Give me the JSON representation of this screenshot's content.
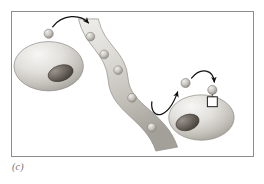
{
  "figure": {
    "caption": "(c)",
    "frame_color": "#8d8d90",
    "background_color": "#ffffff"
  },
  "palette": {
    "cell_light": "#f2f1ef",
    "cell_mid": "#d8d6d2",
    "cell_dark": "#a9a6a1",
    "cell_outline": "#8e8b86",
    "nucleus_light": "#8a837c",
    "nucleus_dark": "#4e4843",
    "nucleus_outline": "#3d3833",
    "matrix_light": "#e9e8e4",
    "matrix_mid": "#c9c7c1",
    "matrix_dark": "#a6a39c",
    "matrix_outline": "#908d87",
    "ligand_light": "#eceae6",
    "ligand_mid": "#c5c2bc",
    "ligand_dark": "#94918b",
    "ligand_outline": "#7c7973",
    "arrow_color": "#111111",
    "receptor_fill": "#ffffff",
    "receptor_outline": "#1a1a1a"
  },
  "elements": {
    "secreting_cell": {
      "label": "secreting cell",
      "cx": 48,
      "cy": 66,
      "rx": 35,
      "ry": 25,
      "nucleus": {
        "cx": 60,
        "cy": 73,
        "rx": 13,
        "ry": 8,
        "rotation": -18
      }
    },
    "target_cell": {
      "label": "target cell",
      "cx": 202,
      "cy": 118,
      "rx": 33,
      "ry": 23,
      "nucleus": {
        "cx": 188,
        "cy": 123,
        "rx": 12,
        "ry": 8,
        "rotation": -18
      }
    },
    "matrix_ribbon": {
      "label": "extracellular matrix fiber",
      "path": "M 78 18 L 98 18 C 104 46 126 50 128 78 C 130 106 166 112 178 148 L 156 152 C 146 120 110 112 108 80 C 106 52 84 46 78 18 Z",
      "embedded_ligands": [
        {
          "cx": 90,
          "cy": 36,
          "r": 4.4
        },
        {
          "cx": 104,
          "cy": 54,
          "r": 4.4
        },
        {
          "cx": 118,
          "cy": 70,
          "r": 4.4
        },
        {
          "cx": 132,
          "cy": 98,
          "r": 4.4
        },
        {
          "cx": 152,
          "cy": 128,
          "r": 4.4
        }
      ]
    },
    "free_ligands": [
      {
        "label": "released-ligand",
        "cx": 48,
        "cy": 33,
        "r": 4.6
      },
      {
        "label": "diffusing-ligand",
        "cx": 186,
        "cy": 83,
        "r": 4.6
      },
      {
        "label": "bound-ligand",
        "cx": 213,
        "cy": 90,
        "r": 4.6
      }
    ],
    "receptor": {
      "label": "cell-surface receptor",
      "x": 208,
      "y": 95,
      "width": 10,
      "height": 10,
      "stem_from_y": 94,
      "stem_to_y": 95
    },
    "arrows": [
      {
        "label": "secretion-arrow",
        "path": "M 52 26 C 62 12 80 12 88 22",
        "head_at": [
          88,
          22
        ],
        "head_angle": 52
      },
      {
        "label": "release-arrow",
        "path": "M 152 102 C 150 120 168 122 178 92",
        "head_at": [
          178,
          92
        ],
        "head_angle": -68
      },
      {
        "label": "binding-arrow",
        "path": "M 192 78 C 202 66 214 70 215 82",
        "head_at": [
          215,
          82
        ],
        "head_angle": 78
      }
    ]
  }
}
